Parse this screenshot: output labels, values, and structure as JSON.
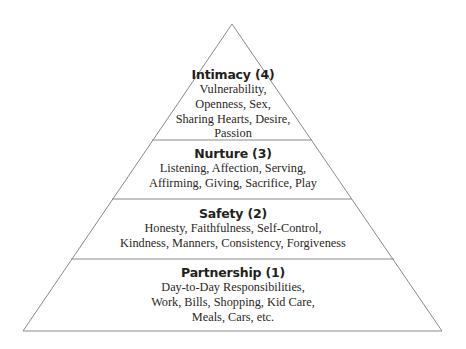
{
  "diagram": {
    "type": "pyramid",
    "shape_color": "#8a8a8a",
    "background_color": "#ffffff",
    "title_color": "#231f20",
    "body_color": "#2b2724",
    "levels": [
      {
        "level": 4,
        "name": "Intimacy",
        "title": "Intimacy (4)",
        "lines": [
          "Vulnerability,",
          "Openness, Sex,",
          "Sharing Hearts, Desire,",
          "Passion"
        ]
      },
      {
        "level": 3,
        "name": "Nurture",
        "title": "Nurture (3)",
        "lines": [
          "Listening, Affection, Serving,",
          "Affirming, Giving, Sacrifice, Play"
        ]
      },
      {
        "level": 2,
        "name": "Safety",
        "title": "Safety (2)",
        "lines": [
          "Honesty, Faithfulness, Self-Control,",
          "Kindness, Manners, Consistency, Forgiveness"
        ]
      },
      {
        "level": 1,
        "name": "Partnership",
        "title": "Partnership (1)",
        "lines": [
          "Day-to-Day Responsibilities,",
          "Work, Bills, Shopping, Kid Care,",
          "Meals, Cars, etc."
        ]
      }
    ]
  }
}
